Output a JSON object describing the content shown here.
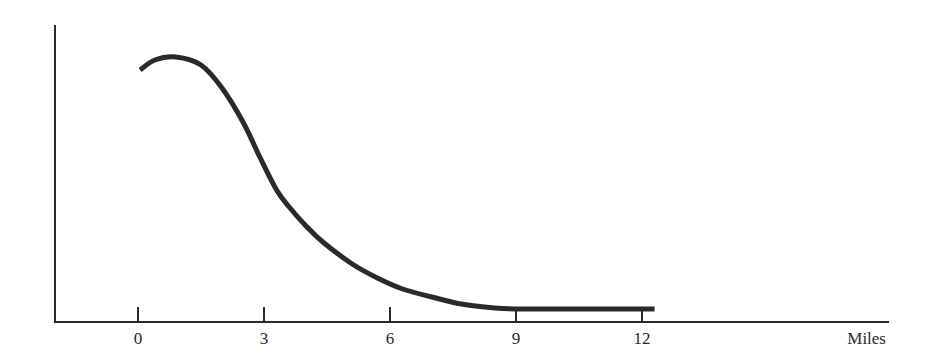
{
  "chart_data": {
    "type": "line",
    "title": "",
    "xlabel": "Miles",
    "ylabel": "",
    "xlim": [
      -2,
      18
    ],
    "ylim": [
      0,
      300
    ],
    "grid": false,
    "legend": null,
    "x_ticks": [
      0,
      3,
      6,
      9,
      12
    ],
    "x_tick_labels": [
      "0",
      "3",
      "6",
      "9",
      "12"
    ],
    "y_ticks": [],
    "series": [
      {
        "name": "curve",
        "color": "#2a2a2a",
        "x": [
          0.05,
          0.4,
          0.9,
          1.5,
          2.0,
          2.5,
          2.9,
          3.3,
          3.6,
          4.0,
          4.4,
          5.1,
          5.7,
          6.3,
          7.0,
          7.7,
          8.5,
          9.0,
          10.0,
          11.0,
          12.3
        ],
        "values": [
          252,
          262,
          265,
          257,
          234,
          200,
          165,
          132,
          115,
          96,
          80,
          58,
          44,
          33,
          25,
          18,
          14,
          13,
          13,
          13,
          13
        ]
      }
    ],
    "annotations": []
  },
  "layout": {
    "origin_px": [
      55,
      322
    ],
    "x_zero_px": 138,
    "px_per_mile": 42,
    "axis_end_px": 889,
    "axis_top_px": 25,
    "colors": {
      "ink": "#2a2a2a",
      "background": "#ffffff"
    }
  }
}
